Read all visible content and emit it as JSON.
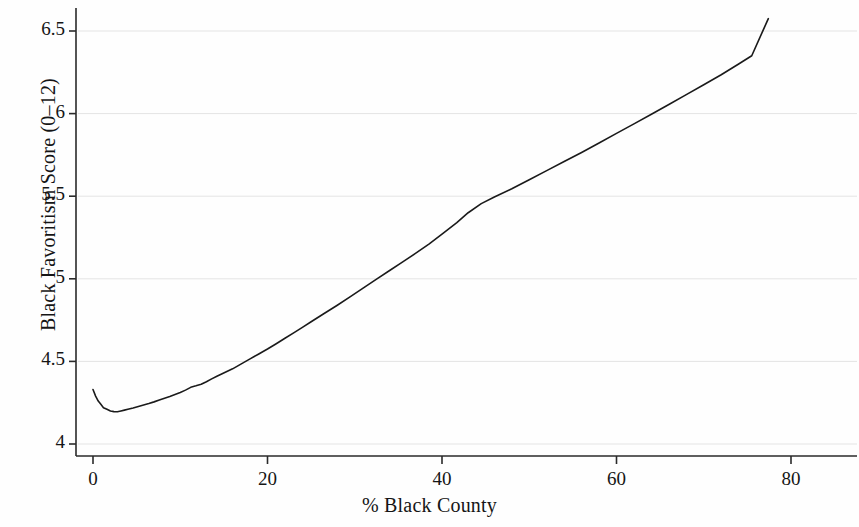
{
  "chart_data": {
    "type": "line",
    "title": "",
    "xlabel": "% Black County",
    "ylabel": "Black Favoritism Score (0–12)",
    "xlim": [
      -1.5,
      87.5
    ],
    "ylim": [
      3.92,
      6.68
    ],
    "xticks": [
      0,
      20,
      40,
      60,
      80
    ],
    "xticklabels": [
      "0",
      "20",
      "40",
      "60",
      "80"
    ],
    "yticks": [
      4,
      4.5,
      5,
      5.5,
      6,
      6.5
    ],
    "yticklabels": [
      "4",
      "4.5",
      "5",
      "5.5",
      "6",
      "6.5"
    ],
    "grid": "horizontal",
    "grid_color": "#e4e4e4",
    "line_color": "#1a1a1a",
    "line_width": 1.6,
    "legend": null,
    "series": [
      {
        "name": "Black Favoritism Score",
        "x": [
          0.0,
          0.3,
          0.6,
          0.9,
          1.2,
          1.6,
          2.0,
          2.4,
          2.8,
          3.2,
          3.6,
          4.0,
          4.6,
          5.2,
          5.8,
          6.4,
          7.0,
          7.6,
          8.2,
          8.8,
          9.4,
          10.0,
          10.6,
          11.2,
          11.8,
          12.4,
          13.0,
          13.6,
          14.2,
          14.8,
          15.4,
          16.0,
          17.0,
          18.0,
          19.0,
          20.0,
          21.0,
          22.0,
          23.0,
          24.0,
          25.0,
          26.4,
          28.0,
          29.5,
          31.0,
          32.5,
          34.0,
          35.5,
          37.0,
          38.5,
          40.0,
          41.7,
          43.0,
          44.5,
          46.0,
          48.0,
          50.0,
          52.0,
          54.0,
          56.0,
          58.0,
          60.0,
          62.0,
          64.0,
          66.0,
          68.0,
          70.0,
          72.0,
          74.0,
          75.5,
          77.4
        ],
        "y": [
          4.33,
          4.29,
          4.26,
          4.24,
          4.22,
          4.21,
          4.2,
          4.196,
          4.195,
          4.2,
          4.205,
          4.21,
          4.218,
          4.227,
          4.236,
          4.245,
          4.255,
          4.266,
          4.277,
          4.288,
          4.3,
          4.312,
          4.326,
          4.343,
          4.352,
          4.362,
          4.377,
          4.394,
          4.41,
          4.425,
          4.44,
          4.455,
          4.485,
          4.515,
          4.545,
          4.575,
          4.607,
          4.64,
          4.673,
          4.706,
          4.74,
          4.787,
          4.84,
          4.892,
          4.945,
          4.998,
          5.05,
          5.102,
          5.155,
          5.21,
          5.27,
          5.34,
          5.4,
          5.455,
          5.495,
          5.545,
          5.6,
          5.655,
          5.71,
          5.765,
          5.822,
          5.88,
          5.938,
          5.996,
          6.055,
          6.115,
          6.175,
          6.235,
          6.3,
          6.35,
          6.575
        ]
      }
    ]
  },
  "axes": {
    "y_axis_name": "y-axis",
    "x_axis_name": "x-axis"
  }
}
